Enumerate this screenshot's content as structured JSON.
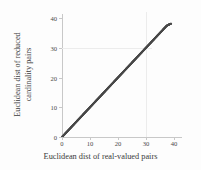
{
  "chart_data": {
    "type": "scatter",
    "title": "",
    "xlabel": "Euclidean dist of real-valued pairs",
    "ylabel_line1": "Euclidean dist of reduced",
    "ylabel_line2": "cardinality pairs",
    "xlim": [
      0,
      41.5
    ],
    "ylim": [
      0,
      41.5
    ],
    "xticks": [
      0,
      10,
      20,
      30,
      40
    ],
    "yticks": [
      0,
      10,
      20,
      30,
      40
    ],
    "xticklabels": [
      "0",
      "10",
      "20",
      "30",
      "40"
    ],
    "yticklabels": [
      "0",
      "10",
      "20",
      "30",
      "40"
    ],
    "grid": true,
    "gridlines_x": [
      30
    ],
    "gridlines_y": [
      30
    ],
    "legend": "none",
    "marker_color": "#4a4a4a",
    "axis_color": "#c8c8c8",
    "grid_color": "#ececec",
    "background_color": "#fdfdfd",
    "series": [
      {
        "name": "reduced cardinality vs real-valued distance",
        "x": [
          0.0,
          0.4,
          0.8,
          1.2,
          1.6,
          2.0,
          2.4,
          2.8,
          3.2,
          3.6,
          4.0,
          4.4,
          4.8,
          5.2,
          5.6,
          6.0,
          6.4,
          6.8,
          7.2,
          7.6,
          8.0,
          8.4,
          8.8,
          9.2,
          9.6,
          10.0,
          10.4,
          10.8,
          11.2,
          11.6,
          12.0,
          12.4,
          12.8,
          13.2,
          13.6,
          14.0,
          14.4,
          14.8,
          15.2,
          15.6,
          16.0,
          16.4,
          16.8,
          17.2,
          17.6,
          18.0,
          18.4,
          18.8,
          19.2,
          19.6,
          20.0,
          20.4,
          20.8,
          21.2,
          21.6,
          22.0,
          22.4,
          22.8,
          23.2,
          23.6,
          24.0,
          24.4,
          24.8,
          25.2,
          25.6,
          26.0,
          26.4,
          26.8,
          27.2,
          27.6,
          28.0,
          28.4,
          28.8,
          29.2,
          29.6,
          30.0,
          30.4,
          30.8,
          31.2,
          31.6,
          32.0,
          32.4,
          32.8,
          33.2,
          33.6,
          34.0,
          34.4,
          34.8,
          35.2,
          35.6,
          36.0,
          36.4,
          36.8,
          37.2,
          37.6,
          38.0,
          38.4,
          38.8,
          39.2,
          39.6,
          40.0,
          40.4
        ],
        "y": [
          0.0,
          0.4,
          0.8,
          1.2,
          1.6,
          2.0,
          2.4,
          2.8,
          3.2,
          3.6,
          4.0,
          4.4,
          4.8,
          5.2,
          5.6,
          6.0,
          6.4,
          6.8,
          7.2,
          7.6,
          8.0,
          8.4,
          8.8,
          9.2,
          9.6,
          10.0,
          10.4,
          10.8,
          11.2,
          11.6,
          12.0,
          12.4,
          12.8,
          13.2,
          13.6,
          14.0,
          14.4,
          14.8,
          15.2,
          15.6,
          16.0,
          16.4,
          16.8,
          17.2,
          17.6,
          18.0,
          18.4,
          18.8,
          19.2,
          19.6,
          20.0,
          20.4,
          20.8,
          21.2,
          21.6,
          22.0,
          22.4,
          22.8,
          23.2,
          23.6,
          24.0,
          24.4,
          24.8,
          25.2,
          25.6,
          26.0,
          26.4,
          26.8,
          27.2,
          27.6,
          28.0,
          28.4,
          28.8,
          29.2,
          29.6,
          30.0,
          30.4,
          30.8,
          31.2,
          31.6,
          32.0,
          32.4,
          32.8,
          33.2,
          33.6,
          34.0,
          34.4,
          34.8,
          35.2,
          35.6,
          36.0,
          36.4,
          36.8,
          37.2,
          37.6,
          38.0,
          38.4,
          38.8,
          39.0,
          39.2,
          39.4,
          39.5
        ]
      }
    ]
  }
}
